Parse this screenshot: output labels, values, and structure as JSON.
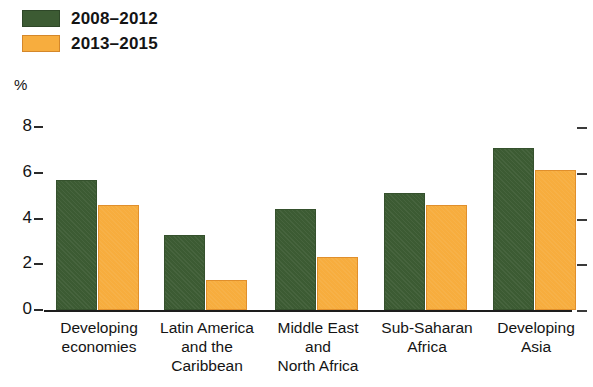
{
  "chart_data": {
    "type": "bar",
    "title": "",
    "subtitle": "",
    "xlabel": "",
    "ylabel": "%",
    "ylim": [
      0,
      8
    ],
    "yticks": [
      0,
      2,
      4,
      6,
      8
    ],
    "ytick_labels": [
      "0",
      "2",
      "4",
      "6",
      "8"
    ],
    "grid": false,
    "legend_position": "top-left",
    "categories": [
      "Developing economies",
      "Latin America and the Caribbean",
      "Middle East and North Africa",
      "Sub-Saharan Africa",
      "Developing Asia"
    ],
    "category_lines": [
      [
        "Developing",
        "economies"
      ],
      [
        "Latin America",
        "and the",
        "Caribbean"
      ],
      [
        "Middle East",
        "and",
        "North Africa"
      ],
      [
        "Sub-Saharan",
        "Africa"
      ],
      [
        "Developing",
        "Asia"
      ]
    ],
    "series": [
      {
        "name": "2008–2012",
        "color": "#3c5b33",
        "values": [
          5.7,
          3.3,
          4.4,
          5.1,
          7.1
        ]
      },
      {
        "name": "2013–2015",
        "color": "#f7ad3e",
        "values": [
          4.6,
          1.3,
          2.3,
          4.6,
          6.1
        ]
      }
    ]
  },
  "legend": {
    "items": [
      {
        "label": "2008–2012",
        "swatch": "green"
      },
      {
        "label": "2013–2015",
        "swatch": "orange"
      }
    ]
  },
  "axis": {
    "unit": "%",
    "ticks": [
      "8",
      "6",
      "4",
      "2",
      "0"
    ]
  },
  "colors": {
    "series_2008_2012": "#3c5b33",
    "series_2013_2015": "#f7ad3e",
    "axis": "#1d1d1d",
    "text": "#141414",
    "background": "#ffffff"
  }
}
